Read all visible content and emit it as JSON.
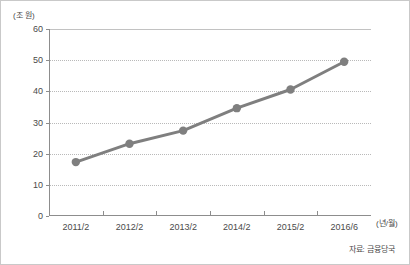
{
  "chart_data": {
    "type": "line",
    "title": "",
    "subtitle": "",
    "xlabel": "(년/월)",
    "ylabel": "(조 원)",
    "categories": [
      "2011/2",
      "2012/2",
      "2013/2",
      "2014/2",
      "2015/2",
      "2016/6"
    ],
    "series": [
      {
        "name": "잔액",
        "values": [
          17.3,
          23.2,
          27.4,
          34.6,
          40.6,
          49.5
        ]
      }
    ],
    "ylim": [
      0,
      60
    ],
    "ytick_labels": [
      "0",
      "10",
      "20",
      "30",
      "40",
      "50",
      "60"
    ],
    "ytick_values": [
      0,
      10,
      20,
      30,
      40,
      50,
      60
    ],
    "grid": true,
    "grid_axis": "y",
    "legend": false,
    "legend_position": "none",
    "annotations": [],
    "source_note": "자료: 금융당국",
    "colors": {
      "line": "#7f7f7f",
      "marker": "#7f7f7f",
      "grid": "#b9b9b9",
      "axis": "#8d8d8d",
      "text": "#4a4a4a",
      "border": "#c9c9c9",
      "background": "#ffffff"
    }
  }
}
